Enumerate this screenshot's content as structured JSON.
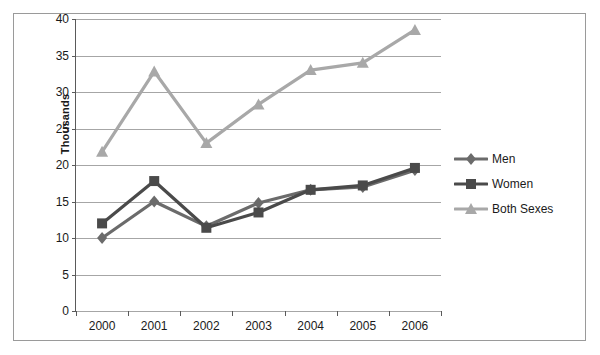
{
  "chart_data": {
    "type": "line",
    "title": "",
    "xlabel": "",
    "ylabel": "Thousands",
    "categories": [
      "2000",
      "2001",
      "2002",
      "2003",
      "2004",
      "2005",
      "2006"
    ],
    "ylim": [
      0,
      40
    ],
    "yticks": [
      0,
      5,
      10,
      15,
      20,
      25,
      30,
      35,
      40
    ],
    "grid": true,
    "legend_position": "right",
    "series": [
      {
        "name": "Men",
        "color": "#6b6b6b",
        "marker": "diamond",
        "values": [
          10.0,
          15.0,
          11.6,
          14.8,
          16.6,
          17.0,
          19.3
        ]
      },
      {
        "name": "Women",
        "color": "#4a4a4a",
        "marker": "square",
        "values": [
          12.0,
          17.8,
          11.4,
          13.5,
          16.6,
          17.2,
          19.6
        ]
      },
      {
        "name": "Both Sexes",
        "color": "#a8a8a8",
        "marker": "triangle",
        "values": [
          21.8,
          32.8,
          23.0,
          28.3,
          33.0,
          34.0,
          38.5
        ]
      }
    ]
  },
  "legend": {
    "items": [
      {
        "label": "Men"
      },
      {
        "label": "Women"
      },
      {
        "label": "Both Sexes"
      }
    ]
  },
  "axes": {
    "y_title": "Thousands"
  }
}
